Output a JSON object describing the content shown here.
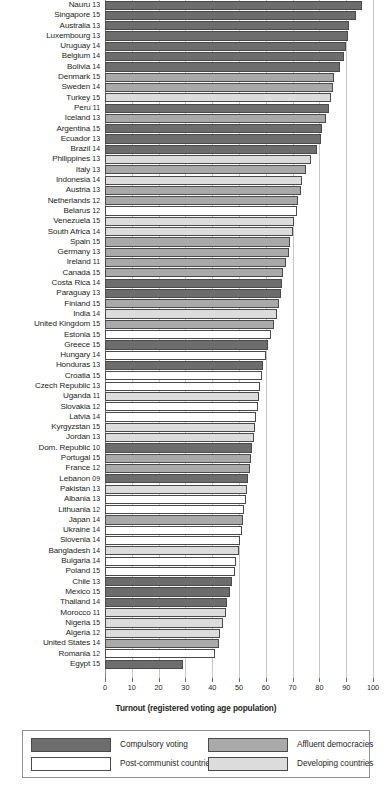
{
  "chart_data": {
    "type": "bar",
    "orientation": "horizontal",
    "title": "",
    "xlabel": "Turnout (registered voting age population)",
    "ylabel": "",
    "xlim": [
      0,
      100
    ],
    "xticks": [
      0,
      10,
      20,
      30,
      40,
      50,
      60,
      70,
      80,
      90,
      100
    ],
    "xtick_labels": [
      "0",
      "10",
      "20",
      "30",
      "40",
      "50",
      "60",
      "70",
      "80",
      "90",
      "100"
    ],
    "grid": true,
    "grid_axis": "x",
    "legend_position": "bottom",
    "categories": [
      "Nauru",
      "Singapore",
      "Australia",
      "Luxembourg",
      "Uruguay",
      "Belgium",
      "Bolivia",
      "Denmark",
      "Sweden",
      "Turkey",
      "Peru",
      "Iceland",
      "Argentina",
      "Ecuador",
      "Brazil",
      "Philippines",
      "Italy",
      "Indonesia",
      "Austria",
      "Netherlands",
      "Belarus",
      "Venezuela",
      "South Africa",
      "Spain",
      "Germany",
      "Ireland",
      "Canada",
      "Costa Rica",
      "Paraguay",
      "Finland",
      "India",
      "United Kingdom",
      "Estonia",
      "Greece",
      "Hungary",
      "Honduras",
      "Croatia",
      "Czech Republic",
      "Uganda",
      "Slovakia",
      "Latvia",
      "Kyrgyzstan",
      "Jordan",
      "Dom. Republic",
      "Portugal",
      "France",
      "Lebanon",
      "Pakistan",
      "Albania",
      "Lithuania",
      "Japan",
      "Ukraine",
      "Slovenia",
      "Bangladesh",
      "Bulgaria",
      "Poland",
      "Chile",
      "Mexico",
      "Thailand",
      "Morocco",
      "Nigeria",
      "Algeria",
      "United States",
      "Romania",
      "Egypt"
    ],
    "values": [
      96.0,
      93.5,
      91.0,
      90.5,
      90.0,
      89.0,
      87.5,
      85.5,
      85.0,
      84.5,
      83.5,
      82.5,
      81.0,
      80.5,
      79.0,
      77.0,
      75.0,
      73.5,
      73.0,
      72.0,
      71.5,
      70.5,
      70.0,
      69.0,
      68.5,
      67.5,
      66.5,
      66.0,
      65.5,
      65.0,
      64.0,
      63.0,
      62.0,
      61.0,
      60.0,
      59.0,
      58.5,
      58.0,
      57.5,
      57.0,
      56.5,
      56.0,
      55.5,
      55.0,
      54.5,
      54.0,
      53.5,
      53.0,
      52.5,
      52.0,
      51.5,
      51.0,
      50.5,
      50.0,
      49.0,
      48.5,
      47.5,
      46.5,
      45.5,
      45.0,
      44.0,
      43.0,
      42.5,
      41.0,
      29.0
    ],
    "years": [
      "13",
      "15",
      "13",
      "13",
      "14",
      "14",
      "14",
      "15",
      "14",
      "15",
      "11",
      "13",
      "15",
      "13",
      "14",
      "13",
      "13",
      "14",
      "13",
      "12",
      "12",
      "15",
      "14",
      "15",
      "13",
      "11",
      "15",
      "14",
      "13",
      "15",
      "14",
      "15",
      "15",
      "15",
      "14",
      "13",
      "15",
      "13",
      "11",
      "12",
      "14",
      "15",
      "13",
      "10",
      "15",
      "12",
      "09",
      "13",
      "13",
      "12",
      "14",
      "14",
      "14",
      "14",
      "14",
      "15",
      "13",
      "15",
      "14",
      "11",
      "15",
      "12",
      "14",
      "12",
      "15"
    ],
    "groups": [
      "compulsory",
      "compulsory",
      "compulsory",
      "compulsory",
      "compulsory",
      "compulsory",
      "compulsory",
      "affluent",
      "affluent",
      "developing",
      "compulsory",
      "affluent",
      "compulsory",
      "compulsory",
      "compulsory",
      "developing",
      "affluent",
      "developing",
      "affluent",
      "affluent",
      "postcom",
      "developing",
      "developing",
      "affluent",
      "affluent",
      "affluent",
      "affluent",
      "compulsory",
      "compulsory",
      "affluent",
      "developing",
      "affluent",
      "postcom",
      "compulsory",
      "postcom",
      "compulsory",
      "postcom",
      "postcom",
      "developing",
      "postcom",
      "postcom",
      "developing",
      "developing",
      "compulsory",
      "affluent",
      "affluent",
      "compulsory",
      "developing",
      "postcom",
      "postcom",
      "affluent",
      "postcom",
      "postcom",
      "developing",
      "postcom",
      "postcom",
      "compulsory",
      "compulsory",
      "compulsory",
      "developing",
      "developing",
      "developing",
      "affluent",
      "postcom",
      "compulsory"
    ],
    "legend": [
      {
        "key": "compulsory",
        "label": "Compulsory voting",
        "color": "#6d6d6d"
      },
      {
        "key": "affluent",
        "label": "Affluent democracies",
        "color": "#a9a9a9"
      },
      {
        "key": "postcom",
        "label": "Post-communist countries",
        "color": "#ffffff"
      },
      {
        "key": "developing",
        "label": "Developing countries",
        "color": "#dcdcdc"
      }
    ]
  }
}
